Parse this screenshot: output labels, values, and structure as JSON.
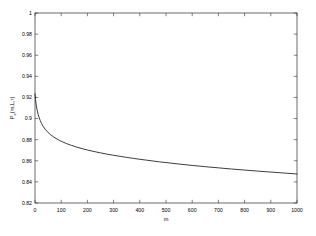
{
  "figure": {
    "background_color": "#ffffff",
    "axis_color": "#2b2b2b",
    "curve_color": "#1a1a1a"
  },
  "chart_data": {
    "type": "line",
    "title": "",
    "subtitle": "",
    "xlabel": "m",
    "ylabel": "P_e(m,L,r)",
    "ylabel_parts": {
      "base": "P",
      "subscript": "e",
      "args": "(m,L,r)"
    },
    "xlim": [
      0,
      1000
    ],
    "ylim": [
      0.82,
      1
    ],
    "grid": false,
    "legend": null,
    "legend_position": "none",
    "box": true,
    "tick_direction": "in",
    "xticks": [
      0,
      100,
      200,
      300,
      400,
      500,
      600,
      700,
      800,
      900,
      1000
    ],
    "xticklabels": [
      "0",
      "100",
      "200",
      "300",
      "400",
      "500",
      "600",
      "700",
      "800",
      "900",
      "1000"
    ],
    "yticks": [
      0.82,
      0.84,
      0.86,
      0.88,
      0.9,
      0.92,
      0.94,
      0.96,
      0.98,
      1
    ],
    "yticklabels": [
      "0.82",
      "0.84",
      "0.86",
      "0.88",
      "0.9",
      "0.92",
      "0.94",
      "0.96",
      "0.98",
      "1"
    ],
    "series": [
      {
        "name": "Pe",
        "color": "#1a1a1a",
        "x": [
          0,
          2,
          5,
          8,
          12,
          16,
          20,
          25,
          30,
          40,
          50,
          60,
          70,
          80,
          90,
          100,
          120,
          140,
          160,
          180,
          200,
          225,
          250,
          275,
          300,
          325,
          350,
          375,
          400,
          425,
          450,
          475,
          500,
          550,
          600,
          650,
          700,
          750,
          800,
          850,
          900,
          950,
          1000
        ],
        "y": [
          0.9235,
          0.9178,
          0.9122,
          0.9082,
          0.904,
          0.9007,
          0.8981,
          0.8953,
          0.893,
          0.8895,
          0.8868,
          0.8846,
          0.8828,
          0.8812,
          0.8798,
          0.8785,
          0.8763,
          0.8745,
          0.8729,
          0.8715,
          0.8702,
          0.8688,
          0.8675,
          0.8663,
          0.8652,
          0.8642,
          0.8632,
          0.8623,
          0.8614,
          0.8606,
          0.8598,
          0.859,
          0.8583,
          0.8569,
          0.8556,
          0.8544,
          0.8533,
          0.8522,
          0.8512,
          0.8502,
          0.8493,
          0.8484,
          0.8475
        ]
      }
    ]
  }
}
